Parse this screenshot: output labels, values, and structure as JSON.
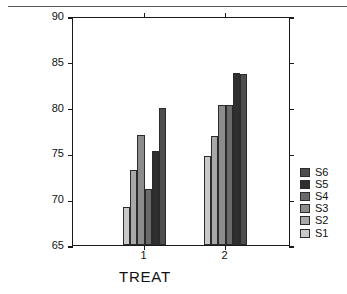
{
  "chart_data": {
    "type": "bar",
    "title": "",
    "xlabel": "TREAT",
    "ylabel": "SCORE",
    "categories": [
      "1",
      "2"
    ],
    "ylim": [
      65,
      90
    ],
    "yticks": [
      65,
      70,
      75,
      80,
      85,
      90
    ],
    "xticks": [
      "1",
      "2"
    ],
    "grid": false,
    "legend_position": "right",
    "series": [
      {
        "name": "S1",
        "color": "#c9c9c9",
        "values": [
          69.2,
          74.7
        ]
      },
      {
        "name": "S2",
        "color": "#a8a8a8",
        "values": [
          73.2,
          76.9
        ]
      },
      {
        "name": "S3",
        "color": "#8c8c8c",
        "values": [
          77.0,
          80.3
        ]
      },
      {
        "name": "S4",
        "color": "#6a6a6a",
        "values": [
          71.1,
          80.3
        ]
      },
      {
        "name": "S5",
        "color": "#2f2f2f",
        "values": [
          75.3,
          83.8
        ]
      },
      {
        "name": "S6",
        "color": "#4e4e4e",
        "values": [
          80.0,
          83.7
        ]
      }
    ],
    "legend_order": [
      "S6",
      "S5",
      "S4",
      "S3",
      "S2",
      "S1"
    ]
  },
  "axis": {
    "y_label": "SCORE",
    "x_label": "TREAT",
    "y_tick_labels": [
      "90",
      "85",
      "80",
      "75",
      "70",
      "65"
    ],
    "x_tick_labels": [
      "1",
      "2"
    ]
  },
  "legend": {
    "entries": [
      {
        "label": "S6",
        "color": "#4e4e4e"
      },
      {
        "label": "S5",
        "color": "#2f2f2f"
      },
      {
        "label": "S4",
        "color": "#6a6a6a"
      },
      {
        "label": "S3",
        "color": "#8c8c8c"
      },
      {
        "label": "S2",
        "color": "#a8a8a8"
      },
      {
        "label": "S1",
        "color": "#c9c9c9"
      }
    ]
  }
}
